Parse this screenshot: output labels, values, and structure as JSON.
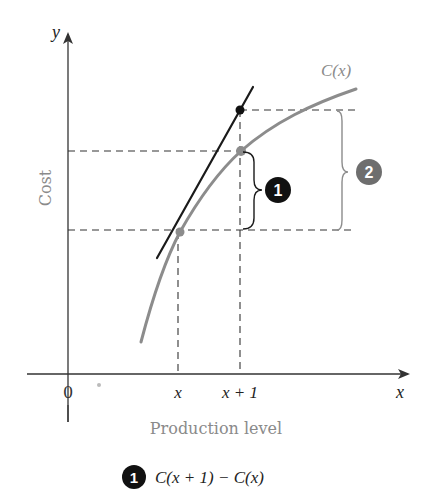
{
  "diagram": {
    "y_axis_label": "y",
    "x_axis_label": "x",
    "axis_title_vertical": "Cost",
    "axis_title_horizontal": "Production level",
    "origin_label": "0",
    "tick_x": "x",
    "tick_x_plus_1": "x + 1",
    "curve_label": "C(x)",
    "badge_1": "1",
    "badge_2": "2",
    "legend": {
      "badge": "1",
      "text": "C(x + 1) − C(x)"
    },
    "colors": {
      "curve": "#8c8c8c",
      "tangent": "#1a1a1a",
      "axis": "#333333",
      "badge_1": "#111111",
      "badge_2": "#6e6e6e",
      "label_gray": "#8a8a8a"
    }
  }
}
